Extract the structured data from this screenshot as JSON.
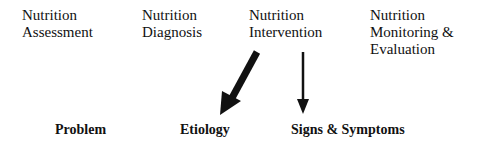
{
  "process_steps": [
    {
      "lines": [
        "Nutrition",
        "Assessment"
      ]
    },
    {
      "lines": [
        "Nutrition",
        "Diagnosis"
      ]
    },
    {
      "lines": [
        "Nutrition",
        "Intervention"
      ]
    },
    {
      "lines": [
        "Nutrition",
        "Monitoring &",
        "Evaluation"
      ]
    }
  ],
  "pes_statement": {
    "problem": "Problem",
    "etiology": "Etiology",
    "signs_symptoms": "Signs & Symptoms"
  },
  "arrows": [
    {
      "name": "intervention-to-etiology",
      "style": "thick",
      "color": "#111111"
    },
    {
      "name": "intervention-to-signs-symptoms",
      "style": "thin",
      "color": "#111111"
    }
  ]
}
